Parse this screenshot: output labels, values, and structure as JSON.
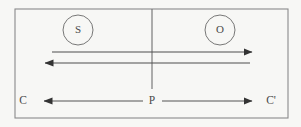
{
  "figure": {
    "type": "optics-ray-diagram",
    "background_color": "#f7f7f5",
    "stroke_color": "#555555",
    "text_color": "#4a4a4a",
    "width": 301,
    "height": 127
  },
  "frame": {
    "name": "outer-rectangle",
    "x": 15,
    "y": 9,
    "width": 273,
    "height": 109,
    "stroke": "#8a8a8a"
  },
  "axis": {
    "name": "vertical-axis",
    "x": 152,
    "y1": 9,
    "y2": 89,
    "stroke": "#6f6f6f"
  },
  "nodes": [
    {
      "id": "source",
      "label": "S",
      "cx": 78,
      "cy": 30,
      "r": 15,
      "stroke": "#777777"
    },
    {
      "id": "observer",
      "label": "O",
      "cx": 220,
      "cy": 30,
      "r": 15,
      "stroke": "#777777"
    }
  ],
  "rays": [
    {
      "id": "ray-forward",
      "label": "",
      "y": 52,
      "x1": 52,
      "x2": 252,
      "direction": "right",
      "stroke": "#4f4f4f"
    },
    {
      "id": "ray-reverse",
      "label": "",
      "y": 63,
      "x1": 250,
      "x2": 45,
      "direction": "left",
      "stroke": "#4f4f4f"
    }
  ],
  "baseline": {
    "y": 101,
    "left_label": "C",
    "left_label_x": 23,
    "center_label": "P",
    "center_label_x": 152,
    "right_label": "C'",
    "right_label_x": 271,
    "left_arrow": {
      "id": "baseline-arrow-left",
      "x_from": 143,
      "x_to": 44,
      "direction": "left"
    },
    "right_arrow": {
      "id": "baseline-arrow-right",
      "x_from": 162,
      "x_to": 252,
      "direction": "right"
    }
  }
}
